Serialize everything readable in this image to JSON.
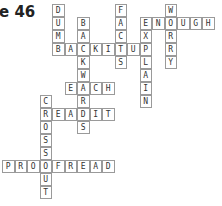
{
  "title": "e 46",
  "grid": {
    "origin_x": 2,
    "origin_y": 4,
    "cell_w": 12.5,
    "cell_h": 13
  },
  "words": [
    {
      "word": "DUMB",
      "dir": "down",
      "col": 4,
      "row": 0
    },
    {
      "word": "BACKITUP",
      "dir": "across",
      "col": 4,
      "row": 3
    },
    {
      "word": "BACKWARDS",
      "dir": "down",
      "col": 6,
      "row": 1
    },
    {
      "word": "FACTS",
      "dir": "down",
      "col": 9,
      "row": 0
    },
    {
      "word": "EXPLAIN",
      "dir": "down",
      "col": 11,
      "row": 1
    },
    {
      "word": "ENOUGH",
      "dir": "across",
      "col": 11,
      "row": 1
    },
    {
      "word": "WORRY",
      "dir": "down",
      "col": 13,
      "row": 0
    },
    {
      "word": "EACH",
      "dir": "across",
      "col": 5,
      "row": 6
    },
    {
      "word": "READIT",
      "dir": "across",
      "col": 3,
      "row": 8
    },
    {
      "word": "CROSSOUT",
      "dir": "down",
      "col": 3,
      "row": 7
    },
    {
      "word": "PROOFREAD",
      "dir": "across",
      "col": 0,
      "row": 12
    }
  ]
}
